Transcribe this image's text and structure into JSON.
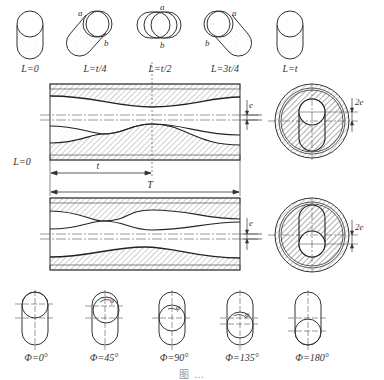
{
  "top_row": {
    "items": [
      {
        "label": "L=0",
        "point_a": "",
        "point_b": ""
      },
      {
        "label": "L=t/4",
        "point_a": "a",
        "point_b": "b"
      },
      {
        "label": "L=t/2",
        "point_a": "a",
        "point_b": "b"
      },
      {
        "label": "L=3t/4",
        "point_a": "a",
        "point_b": "b"
      },
      {
        "label": "L=t",
        "point_a": "",
        "point_b": ""
      }
    ]
  },
  "section_view": {
    "origin_label": "L=0",
    "short_dim_label": "t",
    "long_dim_label": "T",
    "upper_eccentricity_label": "e",
    "upper_offset_label": "2e",
    "lower_eccentricity_label": "e",
    "lower_offset_label": "2e"
  },
  "bottom_row": {
    "angle_symbol": "φ",
    "items": [
      {
        "label": "Φ=0°"
      },
      {
        "label": "Φ=45°"
      },
      {
        "label": "Φ=90°"
      },
      {
        "label": "Φ=135°"
      },
      {
        "label": "Φ=180°"
      }
    ]
  },
  "caption": "图 …"
}
